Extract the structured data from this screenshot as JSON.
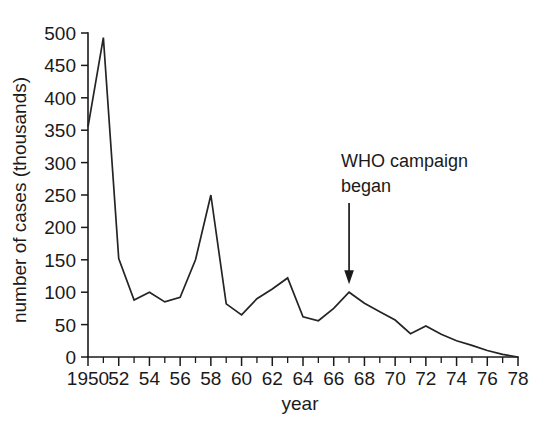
{
  "chart_data": {
    "type": "line",
    "title": "",
    "xlabel": "year",
    "ylabel": "number of cases (thousands)",
    "xlim": [
      1950,
      1978
    ],
    "ylim": [
      0,
      500
    ],
    "grid": false,
    "legend": "none",
    "x_tick_labels": [
      "1950",
      "52",
      "54",
      "56",
      "58",
      "60",
      "62",
      "64",
      "66",
      "68",
      "70",
      "72",
      "74",
      "76",
      "78"
    ],
    "x_tick_values": [
      1950,
      1952,
      1954,
      1956,
      1958,
      1960,
      1962,
      1964,
      1966,
      1968,
      1970,
      1972,
      1974,
      1976,
      1978
    ],
    "x_minor_tick_step": 1,
    "y_tick_labels": [
      "0",
      "50",
      "100",
      "150",
      "200",
      "250",
      "300",
      "350",
      "400",
      "450",
      "500"
    ],
    "y_tick_values": [
      0,
      50,
      100,
      150,
      200,
      250,
      300,
      350,
      400,
      450,
      500
    ],
    "x": [
      1950,
      1951,
      1952,
      1953,
      1954,
      1955,
      1956,
      1957,
      1958,
      1959,
      1960,
      1961,
      1962,
      1963,
      1964,
      1965,
      1966,
      1967,
      1968,
      1969,
      1970,
      1971,
      1972,
      1973,
      1974,
      1975,
      1976,
      1977,
      1978
    ],
    "values": [
      355,
      493,
      152,
      88,
      100,
      85,
      92,
      150,
      250,
      82,
      65,
      90,
      105,
      122,
      62,
      56,
      75,
      100,
      83,
      70,
      57,
      36,
      48,
      35,
      25,
      18,
      10,
      4,
      0
    ],
    "series": [
      {
        "name": "number of cases",
        "color": "#242424",
        "values": [
          355,
          493,
          152,
          88,
          100,
          85,
          92,
          150,
          250,
          82,
          65,
          90,
          105,
          122,
          62,
          56,
          75,
          100,
          83,
          70,
          57,
          36,
          48,
          35,
          25,
          18,
          10,
          4,
          0
        ]
      }
    ],
    "annotations": [
      {
        "text_line_1": "WHO campaign",
        "text_line_2": "began",
        "points_to_year": 1967,
        "points_to_value": 100,
        "arrow_direction": "down"
      }
    ]
  },
  "colors": {
    "line": "#242424",
    "axis": "#1a1a1a",
    "text": "#1a1a1a",
    "background": "#ffffff"
  }
}
